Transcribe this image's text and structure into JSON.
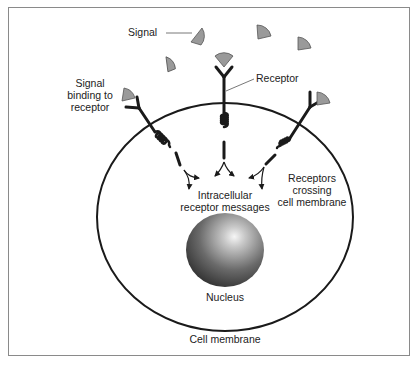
{
  "diagram": {
    "labels": {
      "signal": "Signal",
      "receptor": "Receptor",
      "signal_binding": [
        "Signal",
        "binding to",
        "receptor"
      ],
      "receptors_crossing": [
        "Receptors",
        "crossing",
        "cell membrane"
      ],
      "intracellular": [
        "Intracellular",
        "receptor messages"
      ],
      "nucleus": "Nucleus",
      "cell_membrane": "Cell membrane"
    },
    "colors": {
      "signal_fill": "#9a9a9a",
      "line": "#1a1a1a",
      "frame": "#8a8a8a",
      "nucleus_dark": "#3a3a3a",
      "nucleus_light": "#f4f4f4"
    }
  }
}
